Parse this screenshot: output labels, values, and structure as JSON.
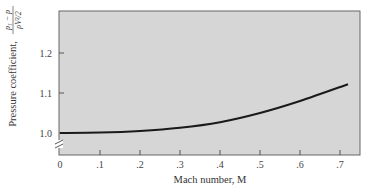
{
  "chart_data": {
    "type": "line",
    "title": "",
    "xlabel": "Mach number, M",
    "ylabel": "Pressure coefficient, (p1 − p)/(ρV²/2)",
    "ylabel_prefix": "Pressure coefficient,",
    "ylabel_numerator": "p₁ − p",
    "ylabel_denominator": "ρV²/2",
    "x_ticks": [
      "0",
      ".1",
      ".2",
      ".3",
      ".4",
      ".5",
      ".6",
      ".7"
    ],
    "x_tick_values": [
      0,
      0.1,
      0.2,
      0.3,
      0.4,
      0.5,
      0.6,
      0.7
    ],
    "y_ticks": [
      "1.0",
      "1.1",
      "1.2"
    ],
    "y_tick_values": [
      1.0,
      1.1,
      1.2
    ],
    "xlim": [
      0,
      0.75
    ],
    "ylim": [
      0.95,
      1.27
    ],
    "y_axis_break": true,
    "grid": false,
    "legend": null,
    "background_color": "#d6d6d6",
    "line_color": "#1a1a1a",
    "series": [
      {
        "name": "Pressure coefficient",
        "x": [
          0,
          0.1,
          0.2,
          0.3,
          0.4,
          0.5,
          0.6,
          0.72
        ],
        "y": [
          1.0,
          1.001,
          1.005,
          1.013,
          1.027,
          1.05,
          1.08,
          1.122
        ]
      }
    ]
  }
}
